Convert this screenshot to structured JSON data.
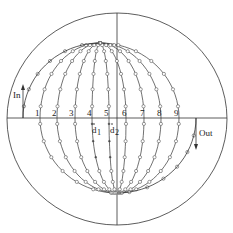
{
  "diagram": {
    "type": "stereographic-net-trajectory",
    "outer_circle": {
      "cx": 117,
      "cy": 119,
      "rx": 110,
      "ry": 106
    },
    "axes": {
      "horizontal_y": 118,
      "vertical_x": 117
    },
    "top_pole": {
      "x": 100,
      "y": 43
    },
    "bottom_pole": {
      "x": 117,
      "y": 193
    },
    "meridian_crossings_x": [
      40,
      57,
      75,
      92,
      109,
      126,
      144,
      161,
      179
    ],
    "tick_labels": [
      "1",
      "2",
      "3",
      "4",
      "5",
      "6",
      "7",
      "8",
      "9"
    ],
    "tick_label_x": [
      35,
      52,
      69,
      87,
      104,
      122,
      140,
      157,
      174
    ],
    "labels": {
      "in": "In",
      "out": "Out",
      "d1": "d",
      "d1_sub": "1",
      "d2": "d",
      "d2_sub": "2"
    },
    "in_path": {
      "start_x": 23,
      "start_y": 118
    },
    "out_path": {
      "start_x": 196,
      "start_y": 118
    },
    "colors": {
      "stroke": "#333333",
      "marker": "#555555",
      "background": "#ffffff"
    }
  }
}
